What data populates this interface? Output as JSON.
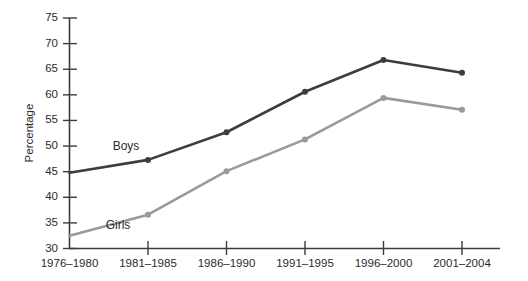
{
  "chart_data": {
    "type": "line",
    "title": "",
    "xlabel": "",
    "ylabel": "Percentage",
    "categories": [
      "1976–1980",
      "1981–1985",
      "1986–1990",
      "1991–1995",
      "1996–2000",
      "2001–2004"
    ],
    "ylim": [
      30,
      75
    ],
    "yticks": [
      30,
      35,
      40,
      45,
      50,
      55,
      60,
      65,
      70,
      75
    ],
    "ytick_labels": [
      "30",
      "35",
      "40",
      "45",
      "50",
      "55",
      "60",
      "65",
      "70",
      "75"
    ],
    "grid": false,
    "legend_position": "inline-annotations",
    "series": [
      {
        "name": "Boys",
        "color": "#3d3d3d",
        "values": [
          44.8,
          47.3,
          52.7,
          60.6,
          66.8,
          64.3
        ],
        "label_x_category": "1981–1985",
        "label_text": "Boys"
      },
      {
        "name": "Girls",
        "color": "#9a9a9a",
        "values": [
          32.5,
          36.6,
          45.1,
          51.3,
          59.4,
          57.1
        ],
        "label_x_category": "1981–1985",
        "label_text": "Girls"
      }
    ],
    "annotations": [
      {
        "text": "Boys",
        "series": "Boys"
      },
      {
        "text": "Girls",
        "series": "Girls"
      }
    ]
  },
  "axis": {
    "y_title": "Percentage",
    "y_tick_labels": [
      "75",
      "70",
      "65",
      "60",
      "55",
      "50",
      "45",
      "40",
      "35",
      "30"
    ],
    "x_tick_labels": [
      "1976–1980",
      "1981–1985",
      "1986–1990",
      "1991–1995",
      "1996–2000",
      "2001–2004"
    ]
  },
  "labels": {
    "boys": "Boys",
    "girls": "Girls"
  },
  "colors": {
    "boys_line": "#3d3d3d",
    "girls_line": "#9a9a9a",
    "axis": "#3c3c3c",
    "text": "#2b2b2b",
    "background": "#ffffff"
  }
}
